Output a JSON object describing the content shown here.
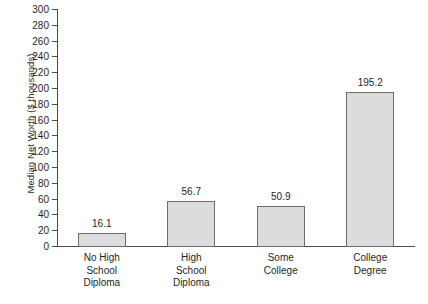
{
  "chart_data": {
    "type": "bar",
    "title": "",
    "xlabel": "",
    "ylabel": "Median Net Worth ($ thousands)",
    "categories": [
      "No High\nSchool\nDiploma",
      "High\nSchool\nDiploma",
      "Some\nCollege",
      "College\nDegree"
    ],
    "category_lines": [
      [
        "No High",
        "School",
        "Diploma"
      ],
      [
        "High",
        "School",
        "Diploma"
      ],
      [
        "Some",
        "College",
        ""
      ],
      [
        "College",
        "Degree",
        ""
      ]
    ],
    "values": [
      16.1,
      56.7,
      50.9,
      195.2
    ],
    "value_labels": [
      "16.1",
      "56.7",
      "50.9",
      "195.2"
    ],
    "ylim": [
      0,
      300
    ],
    "ytick_step": 20,
    "yticks": [
      0,
      20,
      40,
      60,
      80,
      100,
      120,
      140,
      160,
      180,
      200,
      220,
      240,
      260,
      280,
      300
    ],
    "ytick_labels": [
      "0",
      "20",
      "40",
      "60",
      "80",
      "100",
      "120",
      "140",
      "160",
      "180",
      "200",
      "220",
      "240",
      "260",
      "280",
      "300"
    ],
    "grid": false,
    "legend": null,
    "bar_fill_color": "#dcdcdc",
    "bar_border_color": "#6d6d6d",
    "axis_color": "#4a4a4a",
    "background_color": "#ffffff"
  }
}
